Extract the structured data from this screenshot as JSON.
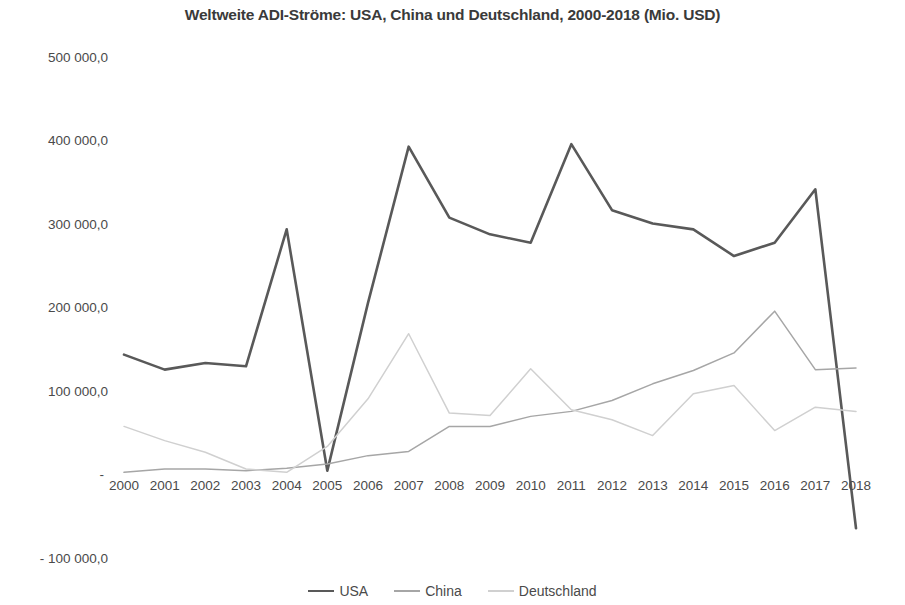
{
  "chart_data": {
    "type": "line",
    "title": "Weltweite ADI-Ströme: USA, China und Deutschland, 2000-2018 (Mio. USD)",
    "xlabel": "",
    "ylabel": "",
    "categories": [
      "2000",
      "2001",
      "2002",
      "2003",
      "2004",
      "2005",
      "2006",
      "2007",
      "2008",
      "2009",
      "2010",
      "2011",
      "2012",
      "2013",
      "2014",
      "2015",
      "2016",
      "2017",
      "2018"
    ],
    "ytick_labels": [
      "500 000,0",
      "400 000,0",
      "300 000,0",
      "200 000,0",
      "100 000,0",
      "-",
      "- 100 000,0"
    ],
    "ytick_values": [
      500000,
      400000,
      300000,
      200000,
      100000,
      0,
      -100000
    ],
    "ylim": [
      -100000,
      500000
    ],
    "grid": false,
    "legend_position": "bottom",
    "series": [
      {
        "name": "USA",
        "color": "#595959",
        "width": 2.6,
        "values": [
          143000,
          125000,
          133000,
          129000,
          293000,
          4000,
          205000,
          392000,
          307000,
          287000,
          277000,
          395000,
          316000,
          300000,
          293000,
          261000,
          277000,
          341000,
          -65000
        ]
      },
      {
        "name": "China",
        "color": "#a6a6a6",
        "width": 1.5,
        "values": [
          2000,
          6000,
          6000,
          4000,
          7000,
          12000,
          22000,
          27000,
          57000,
          57000,
          69000,
          75000,
          88000,
          108000,
          124000,
          145000,
          195000,
          125000,
          127000
        ]
      },
      {
        "name": "Deutschland",
        "color": "#d0d0d0",
        "width": 1.5,
        "values": [
          57000,
          40000,
          26000,
          6000,
          2000,
          33000,
          90000,
          168000,
          73000,
          70000,
          126000,
          77000,
          65000,
          46000,
          96000,
          106000,
          52000,
          80000,
          75000
        ]
      }
    ]
  },
  "legend": {
    "items": [
      {
        "label": "USA"
      },
      {
        "label": "China"
      },
      {
        "label": "Deutschland"
      }
    ]
  }
}
